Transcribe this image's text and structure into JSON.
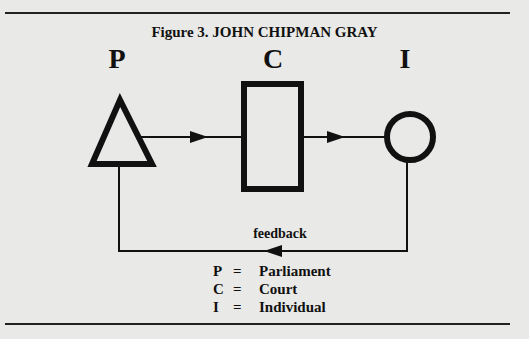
{
  "figure": {
    "title": "Figure 3.  JOHN CHIPMAN GRAY",
    "nodes": [
      {
        "id": "P",
        "label": "P",
        "shape": "triangle"
      },
      {
        "id": "C",
        "label": "C",
        "shape": "rectangle"
      },
      {
        "id": "I",
        "label": "I",
        "shape": "circle"
      }
    ],
    "edges": [
      {
        "from": "P",
        "to": "C"
      },
      {
        "from": "C",
        "to": "I"
      },
      {
        "from": "I",
        "to": "P",
        "label": "feedback"
      }
    ],
    "feedback_label": "feedback",
    "legend": [
      {
        "symbol": "P",
        "eq": "=",
        "name": "Parliament"
      },
      {
        "symbol": "C",
        "eq": "=",
        "name": "Court"
      },
      {
        "symbol": "I",
        "eq": "=",
        "name": "Individual"
      }
    ]
  },
  "colors": {
    "background": "#e9e9e7",
    "ink": "#111111"
  }
}
